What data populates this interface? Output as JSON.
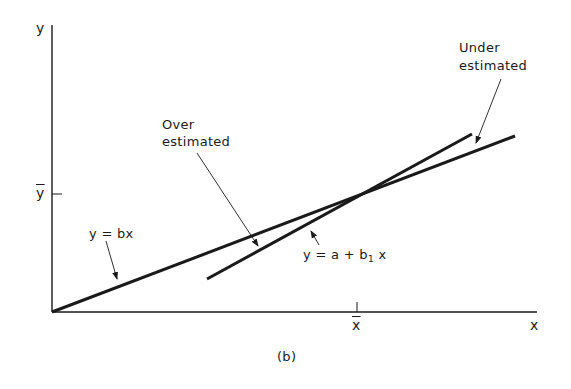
{
  "figure": {
    "caption": "(b)",
    "axes": {
      "x_label": "x",
      "y_label": "y",
      "x_mean_label": "x",
      "y_mean_label": "y"
    },
    "lines": [
      {
        "name": "through-origin",
        "equation": "y = bx",
        "from": [
          52,
          312
        ],
        "to": [
          515,
          136
        ]
      },
      {
        "name": "with-intercept",
        "equation_prefix": "y = a + b",
        "equation_subscript": "1",
        "equation_suffix": "x",
        "from": [
          207,
          279
        ],
        "to": [
          472,
          134
        ]
      }
    ],
    "annotations": {
      "over_line1": "Over",
      "over_line2": "estimated",
      "under_line1": "Under",
      "under_line2": "estimated"
    },
    "colors": {
      "ink": "#1a1a1a",
      "background": "#ffffff"
    }
  }
}
